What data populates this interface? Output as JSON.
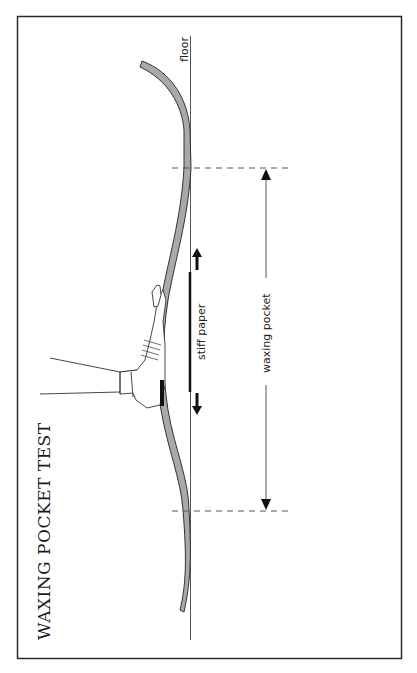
{
  "diagram": {
    "title": "WAXING POCKET TEST",
    "labels": {
      "floor": "floor",
      "stiff_paper": "stiff paper",
      "waxing_pocket": "waxing pocket"
    },
    "colors": {
      "ski_fill": "#a9a9a9",
      "line": "#333333",
      "frame": "#2a2a2a",
      "background": "#ffffff"
    }
  }
}
